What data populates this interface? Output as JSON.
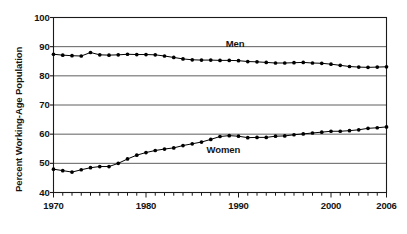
{
  "chart_data": {
    "type": "line",
    "title": "",
    "xlabel": "",
    "ylabel": "Percent Working-Age Population",
    "xlim": [
      1970,
      2006
    ],
    "ylim": [
      40,
      100
    ],
    "yticks": [
      40,
      50,
      60,
      70,
      80,
      90,
      100
    ],
    "ytick_labels": [
      "40",
      "50",
      "60",
      "70",
      "80",
      "90",
      "100"
    ],
    "xticks": [
      1970,
      1980,
      1990,
      2000,
      2006
    ],
    "xtick_labels": [
      "1970",
      "1980",
      "1990",
      "2000",
      "2006"
    ],
    "grid": "horizontal",
    "legend_position": "inline-annotations",
    "x": [
      1970,
      1971,
      1972,
      1973,
      1974,
      1975,
      1976,
      1977,
      1978,
      1979,
      1980,
      1981,
      1982,
      1983,
      1984,
      1985,
      1986,
      1987,
      1988,
      1989,
      1990,
      1991,
      1992,
      1993,
      1994,
      1995,
      1996,
      1997,
      1998,
      1999,
      2000,
      2001,
      2002,
      2003,
      2004,
      2005,
      2006
    ],
    "series": [
      {
        "name": "Men",
        "label": "Men",
        "color": "#000000",
        "values": [
          87.4,
          87.1,
          86.9,
          86.8,
          88.0,
          87.2,
          87.1,
          87.2,
          87.4,
          87.3,
          87.3,
          87.2,
          86.8,
          86.3,
          85.8,
          85.5,
          85.4,
          85.4,
          85.3,
          85.3,
          85.2,
          84.9,
          84.8,
          84.6,
          84.4,
          84.4,
          84.5,
          84.6,
          84.4,
          84.3,
          84.0,
          83.6,
          83.2,
          83.0,
          82.9,
          83.0,
          83.1
        ]
      },
      {
        "name": "Women",
        "label": "Women",
        "color": "#000000",
        "values": [
          48.0,
          47.5,
          47.0,
          47.8,
          48.5,
          48.9,
          48.9,
          50.0,
          51.5,
          52.8,
          53.7,
          54.4,
          54.9,
          55.3,
          56.1,
          56.7,
          57.3,
          58.2,
          59.2,
          59.5,
          59.3,
          58.8,
          58.9,
          58.9,
          59.3,
          59.4,
          59.8,
          60.1,
          60.4,
          60.7,
          61.0,
          61.0,
          61.2,
          61.5,
          62.0,
          62.2,
          62.5
        ]
      }
    ],
    "annotations": [
      {
        "text": "Men",
        "x": 1989.5,
        "y": 91.0
      },
      {
        "text": "Women",
        "x": 1988.0,
        "y": 54.5
      }
    ]
  }
}
